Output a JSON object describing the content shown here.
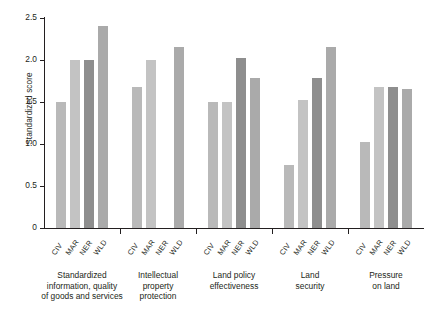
{
  "chart_data": {
    "type": "bar",
    "title": "",
    "subtitle": "",
    "xlabel": "",
    "ylabel": "Standardized score",
    "ylim": [
      0,
      2.5
    ],
    "yticks": [
      "0",
      "0.5",
      "1.0",
      "1.5",
      "2.0",
      "2.5"
    ],
    "ytick_values": [
      0,
      0.5,
      1.0,
      1.5,
      2.0,
      2.5
    ],
    "grid": false,
    "legend": "none",
    "series_labels": [
      "CIV",
      "MAR",
      "NER",
      "WLD"
    ],
    "categories": [
      "Standardized information, quality of goods and services",
      "Intellectual property protection",
      "Land policy effectiveness",
      "Land security",
      "Pressure on land"
    ],
    "groups": [
      {
        "caption_lines": [
          "Standardized",
          "information, quality",
          "of goods and services"
        ],
        "bars": [
          {
            "label": "CIV",
            "value": 1.5,
            "color": "#b9b9b9"
          },
          {
            "label": "MAR",
            "value": 2.0,
            "color": "#c3c3c3"
          },
          {
            "label": "NER",
            "value": 2.0,
            "color": "#8e8e8e"
          },
          {
            "label": "WLD",
            "value": 2.4,
            "color": "#aaaaaa"
          }
        ]
      },
      {
        "caption_lines": [
          "Intellectual",
          "property",
          "protection"
        ],
        "bars": [
          {
            "label": "CIV",
            "value": 1.68,
            "color": "#b9b9b9"
          },
          {
            "label": "MAR",
            "value": 2.0,
            "color": "#c3c3c3"
          },
          {
            "label": "NER",
            "value": 0.0,
            "color": "#8e8e8e"
          },
          {
            "label": "WLD",
            "value": 2.15,
            "color": "#aaaaaa"
          }
        ]
      },
      {
        "caption_lines": [
          "Land policy",
          "effectiveness"
        ],
        "bars": [
          {
            "label": "CIV",
            "value": 1.5,
            "color": "#b9b9b9"
          },
          {
            "label": "MAR",
            "value": 1.5,
            "color": "#c3c3c3"
          },
          {
            "label": "NER",
            "value": 2.02,
            "color": "#8e8e8e"
          },
          {
            "label": "WLD",
            "value": 1.78,
            "color": "#aaaaaa"
          }
        ]
      },
      {
        "caption_lines": [
          "Land",
          "security"
        ],
        "bars": [
          {
            "label": "CIV",
            "value": 0.75,
            "color": "#b9b9b9"
          },
          {
            "label": "MAR",
            "value": 1.52,
            "color": "#c3c3c3"
          },
          {
            "label": "NER",
            "value": 1.78,
            "color": "#8e8e8e"
          },
          {
            "label": "WLD",
            "value": 2.15,
            "color": "#aaaaaa"
          }
        ]
      },
      {
        "caption_lines": [
          "Pressure",
          "on land"
        ],
        "bars": [
          {
            "label": "CIV",
            "value": 1.02,
            "color": "#b9b9b9"
          },
          {
            "label": "MAR",
            "value": 1.68,
            "color": "#c3c3c3"
          },
          {
            "label": "NER",
            "value": 1.68,
            "color": "#8e8e8e"
          },
          {
            "label": "WLD",
            "value": 1.65,
            "color": "#aaaaaa"
          }
        ]
      }
    ],
    "colors": {
      "civ": "#b9b9b9",
      "mar": "#c3c3c3",
      "ner": "#8e8e8e",
      "wld": "#aaaaaa",
      "axis": "#231f20",
      "text": "#231f20",
      "background": "#ffffff"
    }
  }
}
